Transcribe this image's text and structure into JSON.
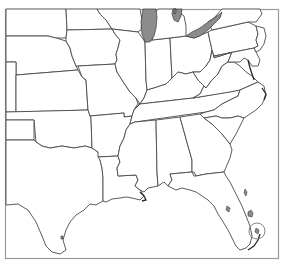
{
  "map": {
    "type": "outline-map",
    "region": "Eastern United States",
    "width": 286,
    "height": 266,
    "colors": {
      "background": "#ffffff",
      "frame": "#9a9a9a",
      "border": "#4a4a4a",
      "water_fill": "#8c8c8c"
    },
    "states": [
      {
        "id": "ND",
        "label": "North Dakota"
      },
      {
        "id": "SD",
        "label": "South Dakota"
      },
      {
        "id": "NE",
        "label": "Nebraska"
      },
      {
        "id": "KS",
        "label": "Kansas"
      },
      {
        "id": "OK",
        "label": "Oklahoma"
      },
      {
        "id": "TX",
        "label": "Texas"
      },
      {
        "id": "MN",
        "label": "Minnesota"
      },
      {
        "id": "IA",
        "label": "Iowa"
      },
      {
        "id": "MO",
        "label": "Missouri"
      },
      {
        "id": "AR",
        "label": "Arkansas"
      },
      {
        "id": "LA",
        "label": "Louisiana"
      },
      {
        "id": "WI",
        "label": "Wisconsin"
      },
      {
        "id": "IL",
        "label": "Illinois"
      },
      {
        "id": "MS",
        "label": "Mississippi"
      },
      {
        "id": "IN",
        "label": "Indiana"
      },
      {
        "id": "KY",
        "label": "Kentucky"
      },
      {
        "id": "TN",
        "label": "Tennessee"
      },
      {
        "id": "AL",
        "label": "Alabama"
      },
      {
        "id": "OH",
        "label": "Ohio"
      },
      {
        "id": "WV",
        "label": "West Virginia"
      },
      {
        "id": "VA",
        "label": "Virginia"
      },
      {
        "id": "NC",
        "label": "North Carolina"
      },
      {
        "id": "SC",
        "label": "South Carolina"
      },
      {
        "id": "GA",
        "label": "Georgia"
      },
      {
        "id": "FL",
        "label": "Florida"
      },
      {
        "id": "PA",
        "label": "Pennsylvania"
      },
      {
        "id": "MD",
        "label": "Maryland"
      },
      {
        "id": "NJ",
        "label": "New Jersey"
      },
      {
        "id": "DE",
        "label": "Delaware"
      },
      {
        "id": "NM",
        "label": "New Mexico"
      },
      {
        "id": "CO",
        "label": "Colorado"
      },
      {
        "id": "MI",
        "label": "Michigan"
      },
      {
        "id": "NY",
        "label": "New York"
      }
    ],
    "water_features": [
      {
        "id": "lake-michigan",
        "label": "Lake Michigan"
      },
      {
        "id": "lake-erie",
        "label": "Lake Erie"
      },
      {
        "id": "lake-huron",
        "label": "Lake Huron"
      },
      {
        "id": "lake-okeechobee",
        "label": "Lake Okeechobee"
      },
      {
        "id": "everglades",
        "label": "Everglades"
      }
    ],
    "highlight": {
      "label": "South Florida circle marker"
    }
  }
}
